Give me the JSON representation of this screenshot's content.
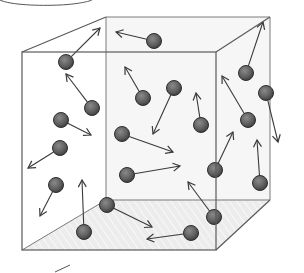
{
  "diagram": {
    "colors": {
      "edge": "#6a6a6a",
      "molecule_fill": "#5f5f5f",
      "molecule_stroke": "#2e2e2e",
      "arrow": "#3a3a3a",
      "floor": "#e6e6e6",
      "back_wall": "#f4f4f4"
    },
    "box": {
      "front": [
        [
          22,
          52
        ],
        [
          216,
          52
        ],
        [
          216,
          250
        ],
        [
          22,
          250
        ]
      ],
      "back": [
        [
          106,
          17
        ],
        [
          270,
          17
        ],
        [
          270,
          200
        ],
        [
          106,
          200
        ]
      ]
    },
    "molecules": [
      {
        "x": 66,
        "y": 62,
        "ax": 100,
        "ay": 28
      },
      {
        "x": 154,
        "y": 41,
        "ax": 116,
        "ay": 32
      },
      {
        "x": 92,
        "y": 108,
        "ax": 66,
        "ay": 74
      },
      {
        "x": 61,
        "y": 120,
        "ax": 91,
        "ay": 135
      },
      {
        "x": 60,
        "y": 148,
        "ax": 28,
        "ay": 168
      },
      {
        "x": 56,
        "y": 185,
        "ax": 40,
        "ay": 216
      },
      {
        "x": 84,
        "y": 232,
        "ax": 82,
        "ay": 180
      },
      {
        "x": 107,
        "y": 205,
        "ax": 152,
        "ay": 227
      },
      {
        "x": 143,
        "y": 98,
        "ax": 125,
        "ay": 67
      },
      {
        "x": 174,
        "y": 88,
        "ax": 153,
        "ay": 134
      },
      {
        "x": 201,
        "y": 125,
        "ax": 196,
        "ay": 93
      },
      {
        "x": 122,
        "y": 134,
        "ax": 173,
        "ay": 152
      },
      {
        "x": 127,
        "y": 175,
        "ax": 180,
        "ay": 166
      },
      {
        "x": 215,
        "y": 170,
        "ax": 233,
        "ay": 132
      },
      {
        "x": 214,
        "y": 217,
        "ax": 188,
        "ay": 182
      },
      {
        "x": 191,
        "y": 233,
        "ax": 147,
        "ay": 239
      },
      {
        "x": 246,
        "y": 73,
        "ax": 263,
        "ay": 22
      },
      {
        "x": 248,
        "y": 120,
        "ax": 222,
        "ay": 76
      },
      {
        "x": 266,
        "y": 93,
        "ax": 278,
        "ay": 142
      },
      {
        "x": 260,
        "y": 183,
        "ax": 257,
        "ay": 140
      }
    ],
    "decorations": {
      "top_curve": "M0,0 C10,5 40,6 60,5 C80,4 90,1 92,0",
      "bottom_stroke": [
        [
          55,
          272
        ],
        [
          70,
          265
        ]
      ]
    }
  }
}
